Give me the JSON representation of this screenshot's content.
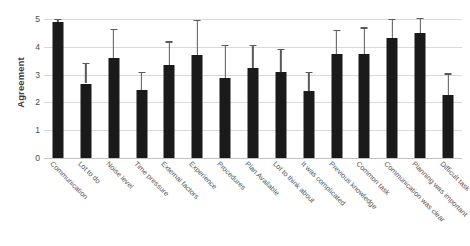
{
  "chart_data": {
    "type": "bar",
    "title": "",
    "subtitle": "",
    "xlabel": "",
    "ylabel": "Agreement",
    "ylim": [
      0,
      5
    ],
    "yticks": [
      0,
      1,
      2,
      3,
      4,
      5
    ],
    "ytick_labels": [
      "0",
      "1",
      "2",
      "3",
      "4",
      "5"
    ],
    "grid": true,
    "legend": "none",
    "bar_color": "#1a1a1a",
    "errorbar_color": "#5a5a5a",
    "gridline_color": "#d9d9d9",
    "error_type": "error bars (upper and lower whiskers with caps)",
    "categories": [
      "Communication",
      "Lot to do",
      "Noise level",
      "Time pressure",
      "External factors",
      "Experience",
      "Procedures",
      "Plan Available",
      "Lot to think about",
      "It was complicated",
      "Previous knowledge",
      "Common task",
      "Communication was clear",
      "Planning was important",
      "Difficult task"
    ],
    "values": [
      4.9,
      2.68,
      3.6,
      2.45,
      3.35,
      3.72,
      2.88,
      3.22,
      3.08,
      2.4,
      3.75,
      3.75,
      4.3,
      4.5,
      2.25
    ],
    "error_upper": [
      0.1,
      0.75,
      1.05,
      0.65,
      0.85,
      1.25,
      1.2,
      0.85,
      0.85,
      0.7,
      0.85,
      0.95,
      0.7,
      0.55,
      0.8
    ],
    "error_lower": [
      0.1,
      0.75,
      1.05,
      0.65,
      0.85,
      1.25,
      1.2,
      0.85,
      0.85,
      0.7,
      0.85,
      0.95,
      0.7,
      0.55,
      0.8
    ],
    "error_upper_visible_only": true
  }
}
